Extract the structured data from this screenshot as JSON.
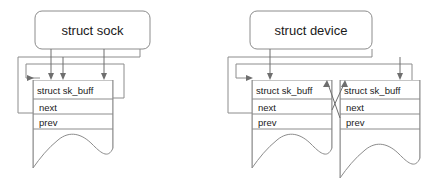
{
  "diagram": {
    "title_left": "struct sock",
    "title_right": "struct device",
    "panels": [
      {
        "id": "sock-panel",
        "owner_label": "struct sock",
        "buffers": [
          {
            "id": "sock-skb-1",
            "header": "struct sk_buff",
            "fields": [
              "next",
              "prev"
            ]
          }
        ]
      },
      {
        "id": "device-panel",
        "owner_label": "struct device",
        "buffers": [
          {
            "id": "device-skb-1",
            "header": "struct sk_buff",
            "fields": [
              "next",
              "prev"
            ]
          },
          {
            "id": "device-skb-2",
            "header": "struct sk_buff",
            "fields": [
              "next",
              "prev"
            ]
          }
        ]
      }
    ],
    "colors": {
      "line": "#8c8c8c",
      "line_dark": "#6e6e6e",
      "text": "#1a1a1a",
      "background": "#ffffff"
    }
  }
}
